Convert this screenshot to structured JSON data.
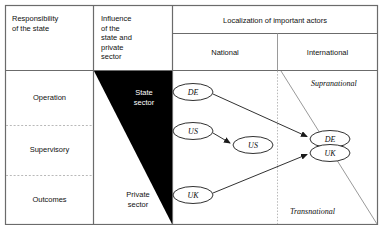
{
  "diagram": {
    "title_columns": {
      "col1_header": "Responsibility\nof the state",
      "col2_header": "Influence\nof the\nstate and\nprivate\nsector",
      "col3_header": "Localization of important actors",
      "col3_sub_left": "National",
      "col3_sub_right": "International"
    },
    "rows": [
      {
        "label": "Operation"
      },
      {
        "label": "Supervisory"
      },
      {
        "label": "Outcomes"
      }
    ],
    "sectors": [
      {
        "label": "State\nsector",
        "on": "black"
      },
      {
        "label": "Private\nsector",
        "on": "white"
      }
    ],
    "zones": [
      {
        "label": "Supranational"
      },
      {
        "label": "Transnational"
      }
    ],
    "nodes": [
      {
        "id": "de-national",
        "label": "DE",
        "cx": 193,
        "cy": 92
      },
      {
        "id": "us-national",
        "label": "US",
        "cx": 193,
        "cy": 131
      },
      {
        "id": "uk-national",
        "label": "UK",
        "cx": 193,
        "cy": 195
      },
      {
        "id": "us-mid",
        "label": "US",
        "cx": 253,
        "cy": 145
      },
      {
        "id": "de-international",
        "label": "DE",
        "cx": 330,
        "cy": 139
      },
      {
        "id": "uk-international",
        "label": "UK",
        "cx": 330,
        "cy": 153
      }
    ],
    "arrows": [
      {
        "id": "de-to-de",
        "from": "de-national",
        "to": "de-international",
        "x1": 213,
        "y1": 94,
        "x2": 309,
        "y2": 137
      },
      {
        "id": "us-to-us",
        "from": "us-national",
        "to": "us-mid",
        "x1": 213,
        "y1": 133,
        "x2": 232,
        "y2": 144
      },
      {
        "id": "uk-to-uk",
        "from": "uk-national",
        "to": "uk-international",
        "x1": 213,
        "y1": 193,
        "x2": 309,
        "y2": 153
      }
    ],
    "colors": {
      "border": "#6b6b6b",
      "fill_black": "#000000",
      "fill_white": "#ffffff",
      "dotted": "#b9b9b9",
      "zone_divider": "#9a9a9a",
      "arrow": "#1a1a1a"
    }
  }
}
